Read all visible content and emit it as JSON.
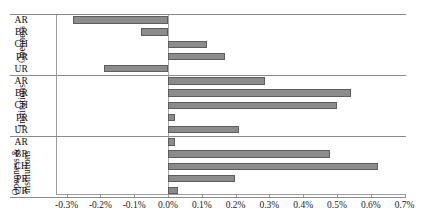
{
  "chart_data": {
    "type": "bar",
    "orientation": "horizontal",
    "title": "",
    "xlabel": "",
    "ylabel": "",
    "xlim": [
      -0.003,
      0.007
    ],
    "xtick_labels": [
      "-0.3%",
      "-0.2%",
      "-0.1%",
      "0.0%",
      "0.1%",
      "0.2%",
      "0.3%",
      "0.4%",
      "0.5%",
      "0.6%",
      "0.7%"
    ],
    "xtick_values": [
      -0.3,
      -0.2,
      -0.1,
      0.0,
      0.1,
      0.2,
      0.3,
      0.4,
      0.5,
      0.6,
      0.7
    ],
    "units": "percent",
    "grid": false,
    "legend": "none",
    "bar_color": "#8c8c8c",
    "bar_edge_color": "#5d5d5d",
    "groups": [
      {
        "name": "Openness",
        "label_lines": [
          "Openness"
        ],
        "categories": [
          "AR",
          "BR",
          "CH",
          "PR",
          "UR"
        ],
        "values": [
          -0.28,
          -0.08,
          0.115,
          0.17,
          -0.19
        ]
      },
      {
        "name": "Institutions",
        "label_lines": [
          "Institutions"
        ],
        "categories": [
          "AR",
          "BR",
          "CH",
          "PR",
          "UR"
        ],
        "values": [
          0.287,
          0.54,
          0.5,
          0.02,
          0.21
        ]
      },
      {
        "name": "Openness & institutions",
        "label_lines": [
          "Openness &",
          "institutions"
        ],
        "categories": [
          "AR",
          "BR",
          "CH",
          "PR",
          "UR"
        ],
        "values": [
          0.02,
          0.478,
          0.62,
          0.197,
          0.03
        ]
      }
    ]
  }
}
